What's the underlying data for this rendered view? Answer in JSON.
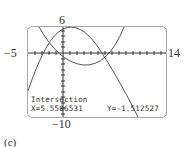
{
  "window": {
    "xmin_label": "−5",
    "xmax_label": "14",
    "ymax_label": "6",
    "ymin_label": "−10"
  },
  "calc": {
    "mode": "Intersection",
    "x_readout": "X=5.5586531",
    "y_readout": "Y=-1.512527"
  },
  "caption": "(c)",
  "colors": {
    "curve": "#555555",
    "axis": "#333333",
    "border": "#aaaaaa"
  }
}
